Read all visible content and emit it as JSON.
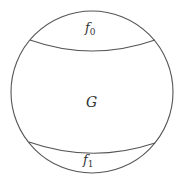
{
  "diagram": {
    "regions": [
      {
        "id": "top-cap",
        "label": "f",
        "subscript": "0"
      },
      {
        "id": "middle",
        "label": "G",
        "subscript": ""
      },
      {
        "id": "bottom-cap",
        "label": "f",
        "subscript": "1"
      }
    ],
    "stroke_color": "#555555"
  }
}
